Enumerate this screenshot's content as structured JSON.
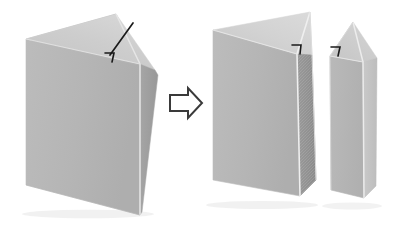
{
  "figure": {
    "description": "A grey folded paper prism with a diagonal cut line and a small hook-shaped notch mark transforms, via a right-pointing arrow, into two separate folded pieces: a large folded piece on the left and a narrow folded wedge on the right. Each resulting piece carries a matching hook-shaped notch mark at the cut edge.",
    "background_color": "#ffffff"
  },
  "palette": {
    "face_top_light": "#d0d0d0",
    "face_left_mid": "#b6b6b6",
    "face_right_dark": "#9d9d9d",
    "face_inner_dark": "#8f8f8f",
    "face_highlight": "#e2e2e2",
    "edge_line": "#f4f4f4",
    "outline": "#c9c9c9",
    "mark_line": "#1a1a1a",
    "arrow_fill": "#ffffff",
    "arrow_stroke": "#3a3a3a",
    "shadow": "#e8e8e8"
  },
  "panels": {
    "before": {
      "label": "before-cut-shape",
      "state": "folded card with cut line",
      "marks": {
        "cut_line": "diagonal score line from top apex down to notch",
        "notch": "hook-shaped notch mark"
      }
    },
    "after": {
      "label": "after-cut-shapes",
      "state": "two separated folded pieces",
      "pieces": [
        {
          "name": "large-folded-piece",
          "marks": {
            "notch": "hook-shaped notch mark"
          }
        },
        {
          "name": "narrow-folded-wedge",
          "marks": {
            "notch": "hook-shaped notch mark"
          }
        }
      ]
    }
  },
  "arrow": {
    "name": "transformation-arrow",
    "direction": "right",
    "style": "outlined block arrow"
  }
}
